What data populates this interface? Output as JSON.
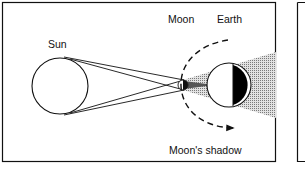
{
  "diagram": {
    "labels": {
      "sun": "Sun",
      "moon": "Moon",
      "earth": "Earth",
      "moon_shadow": "Moon's shadow"
    },
    "colors": {
      "line": "#111111",
      "shadow_fill": "#bdbdbd",
      "umbra": "#000000",
      "background": "#ffffff"
    }
  }
}
